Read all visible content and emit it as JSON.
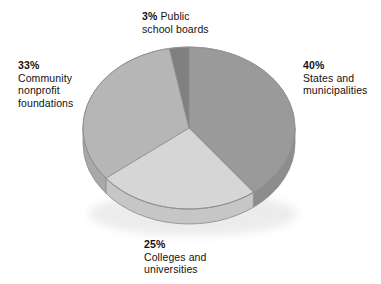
{
  "chart_data": {
    "type": "pie",
    "title": "",
    "subtitle": "",
    "xlabel": "",
    "ylabel": "",
    "legend_position": "callout-labels",
    "grid": false,
    "style": "3d-exploded-none",
    "start_angle_deg": 0,
    "direction": "clockwise",
    "categories": [
      "States and municipalities",
      "Colleges and universities",
      "Community nonprofit foundations",
      "Public school boards"
    ],
    "values": [
      40,
      25,
      33,
      3
    ],
    "value_unit": "%",
    "colors": [
      "#9a9a9a",
      "#d6d6d6",
      "#b6b6b6",
      "#808080"
    ],
    "side_colors": [
      "#8d8d8d",
      "#c6c6c6",
      "#a9a9a9",
      "#767676"
    ],
    "slices": [
      {
        "id": "states",
        "percent_label": "40%",
        "value": 40,
        "desc_lines": [
          "States and",
          "municipalities"
        ],
        "color": "#9a9a9a",
        "side_color": "#8d8d8d"
      },
      {
        "id": "colleges",
        "percent_label": "25%",
        "value": 25,
        "desc_lines": [
          "Colleges and",
          "universities"
        ],
        "color": "#d6d6d6",
        "side_color": "#c6c6c6"
      },
      {
        "id": "community",
        "percent_label": "33%",
        "value": 33,
        "desc_lines": [
          "Community",
          "nonprofit",
          "foundations"
        ],
        "color": "#b6b6b6",
        "side_color": "#a9a9a9"
      },
      {
        "id": "public",
        "percent_label": "3%",
        "value": 3,
        "desc_lines": [
          "Public",
          "school boards"
        ],
        "color": "#808080",
        "side_color": "#767676"
      }
    ]
  },
  "labels": {
    "public": {
      "pct": "3%",
      "line1": "Public",
      "line2": "school boards"
    },
    "states": {
      "pct": "40%",
      "line1": "States and",
      "line2": "municipalities"
    },
    "community": {
      "pct": "33%",
      "line1": "Community",
      "line2": "nonprofit",
      "line3": "foundations"
    },
    "colleges": {
      "pct": "25%",
      "line1": "Colleges and",
      "line2": "universities"
    }
  },
  "geometry": {
    "cx": 189,
    "cy": 128,
    "rx": 106,
    "ry": 81,
    "depth": 15
  }
}
